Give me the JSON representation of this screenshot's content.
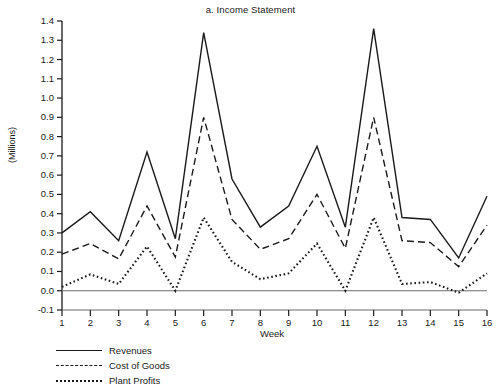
{
  "chart_data": {
    "type": "line",
    "title": "a. Income Statement",
    "xlabel": "Week",
    "ylabel": "(Millions)",
    "grid": false,
    "legend_position": "below-left",
    "xlim": [
      1,
      16
    ],
    "ylim": [
      -0.1,
      1.4
    ],
    "ytick_labels": [
      "1.4",
      "1.3",
      "1.2",
      "1.1",
      "1.0",
      "0.9",
      "0.8",
      "0.7",
      "0.6",
      "0.5",
      "0.4",
      "0.3",
      "0.2",
      "0.1",
      "0.0",
      "-0.1"
    ],
    "ytick_values": [
      1.4,
      1.3,
      1.2,
      1.1,
      1.0,
      0.9,
      0.8,
      0.7,
      0.6,
      0.5,
      0.4,
      0.3,
      0.2,
      0.1,
      0.0,
      -0.1
    ],
    "categories": [
      1,
      2,
      3,
      4,
      5,
      6,
      7,
      8,
      9,
      10,
      11,
      12,
      13,
      14,
      15,
      16
    ],
    "xtick_labels": [
      "1",
      "2",
      "3",
      "4",
      "5",
      "6",
      "7",
      "8",
      "9",
      "10",
      "11",
      "12",
      "13",
      "14",
      "15",
      "16"
    ],
    "series": [
      {
        "name": "Revenues",
        "style": "solid",
        "color": "#1a1a1a",
        "values": [
          0.3,
          0.41,
          0.26,
          0.72,
          0.27,
          1.34,
          0.58,
          0.33,
          0.44,
          0.75,
          0.33,
          1.36,
          0.38,
          0.37,
          0.17,
          0.49
        ]
      },
      {
        "name": "Cost of Goods",
        "style": "dashed",
        "color": "#1a1a1a",
        "values": [
          0.19,
          0.245,
          0.165,
          0.44,
          0.175,
          0.9,
          0.37,
          0.215,
          0.27,
          0.5,
          0.22,
          0.9,
          0.26,
          0.25,
          0.125,
          0.34
        ]
      },
      {
        "name": "Plant Profits",
        "style": "dotted",
        "color": "#1a1a1a",
        "values": [
          0.02,
          0.085,
          0.035,
          0.23,
          0.0,
          0.38,
          0.15,
          0.06,
          0.09,
          0.245,
          0.0,
          0.38,
          0.035,
          0.045,
          -0.01,
          0.09
        ]
      }
    ]
  },
  "legend": {
    "items": [
      {
        "label": "Revenues",
        "style": "solid"
      },
      {
        "label": "Cost of Goods",
        "style": "dashed"
      },
      {
        "label": "Plant Profits",
        "style": "dotted"
      }
    ]
  }
}
